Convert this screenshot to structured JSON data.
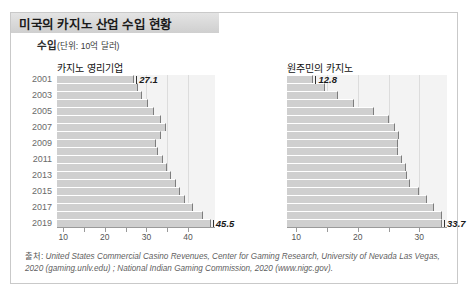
{
  "header": {
    "title": "미국의 카지노 산업 수입 현황"
  },
  "subtitle": {
    "bold": "수입",
    "unit": "(단위: 10억 달러)"
  },
  "source": {
    "label": "출처:",
    "text": "United States Commercial Casino Revenues, Center for Gaming Research, University of Nevada Las Vegas, 2020 (gaming.unlv.edu) ; National Indian Gaming Commission, 2020 (www.nigc.gov)."
  },
  "chart_data": {
    "type": "bar",
    "title": "미국의 카지노 산업 수입 현황",
    "xlabel": "",
    "ylabel": "",
    "unit": "10억 달러",
    "orientation": "horizontal",
    "grid": true,
    "legend_position": "none",
    "categories": [
      "2001",
      "2002",
      "2003",
      "2004",
      "2005",
      "2006",
      "2007",
      "2008",
      "2009",
      "2010",
      "2011",
      "2012",
      "2013",
      "2014",
      "2015",
      "2016",
      "2017",
      "2018",
      "2019"
    ],
    "tick_labels_shown": [
      "2001",
      "2003",
      "2005",
      "2007",
      "2009",
      "2011",
      "2013",
      "2015",
      "2017",
      "2019"
    ],
    "panels": [
      {
        "name": "카지노 영리기업",
        "xlim": [
          8.5,
          46.5
        ],
        "xticks": [
          10,
          15,
          20,
          25,
          30,
          35,
          40
        ],
        "xtick_labels": [
          "10",
          "",
          "20",
          "",
          "30",
          "",
          "40"
        ],
        "annotations": [
          {
            "category": "2001",
            "value": 27.1,
            "label": "27.1"
          },
          {
            "category": "2019",
            "value": 45.5,
            "label": "45.5"
          }
        ],
        "values": [
          27.1,
          28.1,
          29.0,
          30.3,
          31.9,
          33.5,
          34.6,
          33.5,
          32.4,
          32.9,
          34.0,
          35.0,
          36.0,
          37.0,
          38.2,
          39.3,
          41.2,
          43.6,
          45.5
        ]
      },
      {
        "name": "원주민의 카지노",
        "xlim": [
          8.5,
          34.5
        ],
        "xticks": [
          10,
          15,
          20,
          25,
          30
        ],
        "xtick_labels": [
          "10",
          "",
          "20",
          "",
          "30"
        ],
        "annotations": [
          {
            "category": "2001",
            "value": 12.8,
            "label": "12.8"
          },
          {
            "category": "2019",
            "value": 33.7,
            "label": "33.7"
          }
        ],
        "values": [
          12.8,
          14.7,
          16.8,
          19.4,
          22.6,
          25.1,
          26.0,
          26.7,
          26.5,
          26.5,
          27.2,
          27.9,
          28.0,
          28.5,
          29.9,
          31.2,
          32.4,
          33.7,
          33.7
        ]
      }
    ]
  }
}
